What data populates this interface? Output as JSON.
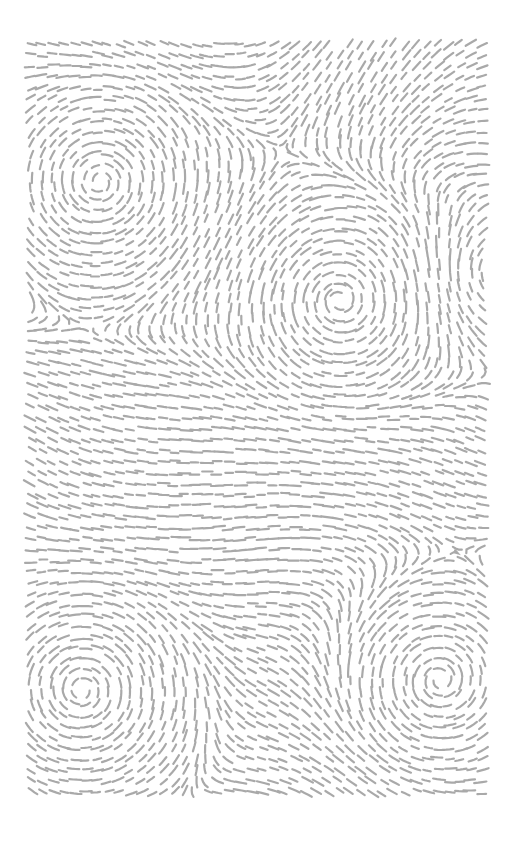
{
  "artwork": {
    "kind": "flow-field-dashes",
    "canvas": {
      "width": 515,
      "height": 847,
      "background": "#ffffff"
    },
    "field_area": {
      "x": 27,
      "y": 40,
      "width": 465,
      "height": 760
    },
    "stroke": {
      "color": "#a9a9a9",
      "width": 2.2,
      "dash_length": 10
    },
    "grid_spacing": 11,
    "vortices": [
      {
        "x": 100,
        "y": 182,
        "strength": 1.0,
        "radius": 95,
        "dir": 1
      },
      {
        "x": 340,
        "y": 300,
        "strength": 1.0,
        "radius": 90,
        "dir": -1
      },
      {
        "x": 500,
        "y": 275,
        "strength": 0.9,
        "radius": 60,
        "dir": 1
      },
      {
        "x": 82,
        "y": 690,
        "strength": 1.0,
        "radius": 100,
        "dir": 1
      },
      {
        "x": 440,
        "y": 680,
        "strength": 1.0,
        "radius": 85,
        "dir": -1
      }
    ],
    "waves": [
      {
        "amp": 0.55,
        "fx": 0.012,
        "fy": 0.004,
        "phase": 0.3
      },
      {
        "amp": 0.45,
        "fx": 0.006,
        "fy": 0.011,
        "phase": 1.7
      }
    ]
  }
}
